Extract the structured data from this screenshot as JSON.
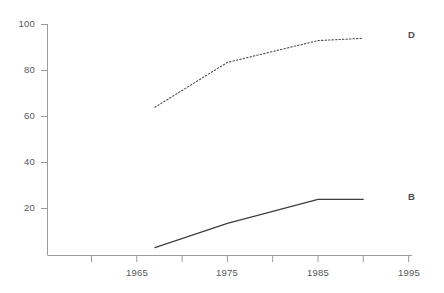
{
  "chart_data": {
    "type": "line",
    "title": "",
    "subtitle": "",
    "xlabel": "",
    "ylabel": "",
    "xlim": [
      1960,
      1995
    ],
    "ylim": [
      0,
      100
    ],
    "yticks": [
      20,
      40,
      60,
      80,
      100
    ],
    "ytick_labels": [
      "20",
      "40",
      "60",
      "80",
      "100"
    ],
    "xticks": [
      1965,
      1975,
      1985,
      1995
    ],
    "xtick_labels": [
      "1965",
      "1975",
      "1985",
      "1995"
    ],
    "xminor_ticks": [
      1960,
      1970,
      1980,
      1990
    ],
    "grid": false,
    "legend_position": "right-inline",
    "series": [
      {
        "name": "D",
        "label": "D",
        "style": "dotted",
        "color": "#4d4d4f",
        "x": [
          1967,
          1975,
          1985,
          1990
        ],
        "values": [
          64,
          83.5,
          93,
          94
        ]
      },
      {
        "name": "B",
        "label": "B",
        "style": "solid",
        "color": "#3d3d3f",
        "x": [
          1967,
          1975,
          1985,
          1990
        ],
        "values": [
          3,
          13.5,
          24,
          24
        ]
      }
    ]
  },
  "axes": {
    "y_axis_name": "y-axis",
    "x_axis_name": "x-axis"
  },
  "colors": {
    "axis": "#9a9a9c",
    "text": "#58585a",
    "series_d": "#4d4d4f",
    "series_b": "#3d3d3f",
    "background": "#ffffff"
  }
}
